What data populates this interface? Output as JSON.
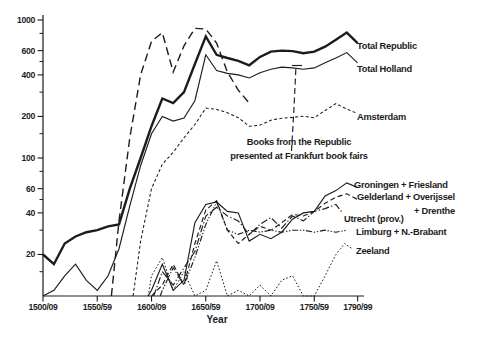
{
  "figure_title": "",
  "ink_color": "#1c1c1c",
  "background_color": "#ffffff",
  "chart_data": {
    "type": "line",
    "title": "",
    "xlabel": "Year",
    "ylabel": "",
    "y_axis": {
      "scale": "log",
      "baseline_value": 10,
      "top_value": 1100,
      "major_ticks": [
        1000,
        600,
        400,
        200,
        100,
        60,
        40,
        20
      ],
      "major_tick_labels": [
        "1000",
        "600",
        "400",
        "200",
        "100",
        "60",
        "40",
        "20"
      ],
      "minor_ticks": [
        800,
        500,
        300,
        150,
        80,
        50,
        30,
        15
      ]
    },
    "x_axis": {
      "tick_years": [
        1500,
        1550,
        1600,
        1650,
        1700,
        1750,
        1790
      ],
      "tick_labels": [
        "1500/09",
        "1550/59",
        "1600/09",
        "1650/59",
        "1700/09",
        "1750/59",
        "1790/99"
      ]
    },
    "annotation": {
      "lines": [
        "Books from the Republic",
        "presented at Frankfurt book fairs"
      ]
    },
    "series": [
      {
        "id": "frankfurt",
        "label_lines": [],
        "style": "dash-long",
        "points": [
          [
            1563,
            10
          ],
          [
            1570,
            35
          ],
          [
            1580,
            140
          ],
          [
            1590,
            400
          ],
          [
            1600,
            700
          ],
          [
            1610,
            810
          ],
          [
            1620,
            420
          ],
          [
            1630,
            650
          ],
          [
            1640,
            870
          ],
          [
            1650,
            860
          ],
          [
            1660,
            680
          ],
          [
            1670,
            420
          ],
          [
            1680,
            310
          ],
          [
            1690,
            250
          ]
        ]
      },
      {
        "id": "zeeland",
        "label_lines": [
          "Zeeland"
        ],
        "style": "dot-fine",
        "points": [
          [
            1597,
            10
          ],
          [
            1600,
            14
          ],
          [
            1610,
            19
          ],
          [
            1620,
            11
          ],
          [
            1630,
            15
          ],
          [
            1640,
            10
          ],
          [
            1650,
            11
          ],
          [
            1660,
            18
          ],
          [
            1670,
            10
          ],
          [
            1680,
            11
          ],
          [
            1690,
            10
          ],
          [
            1700,
            12
          ],
          [
            1710,
            10
          ],
          [
            1720,
            13
          ],
          [
            1730,
            14
          ],
          [
            1740,
            10
          ],
          [
            1750,
            10
          ],
          [
            1760,
            14
          ],
          [
            1770,
            20
          ],
          [
            1778,
            24
          ],
          [
            1785,
            22
          ]
        ]
      },
      {
        "id": "limburg-brabant",
        "label_lines": [
          "Limburg + N.-Brabant"
        ],
        "style": "dash-dot-dot",
        "points": [
          [
            1608,
            10
          ],
          [
            1610,
            11
          ],
          [
            1620,
            16
          ],
          [
            1630,
            12
          ],
          [
            1640,
            19
          ],
          [
            1650,
            33
          ],
          [
            1660,
            48
          ],
          [
            1670,
            30
          ],
          [
            1680,
            28
          ],
          [
            1690,
            30
          ],
          [
            1700,
            29
          ],
          [
            1710,
            30
          ],
          [
            1720,
            29
          ],
          [
            1730,
            30
          ],
          [
            1740,
            30
          ],
          [
            1750,
            29
          ],
          [
            1760,
            30
          ],
          [
            1770,
            29
          ],
          [
            1780,
            30
          ]
        ]
      },
      {
        "id": "utrecht",
        "label_lines": [
          "Utrecht (prov.)"
        ],
        "style": "dash-dot",
        "points": [
          [
            1602,
            10
          ],
          [
            1610,
            15
          ],
          [
            1620,
            12
          ],
          [
            1630,
            16
          ],
          [
            1640,
            21
          ],
          [
            1650,
            38
          ],
          [
            1660,
            44
          ],
          [
            1670,
            38
          ],
          [
            1680,
            35
          ],
          [
            1690,
            28
          ],
          [
            1700,
            33
          ],
          [
            1710,
            37
          ],
          [
            1720,
            31
          ],
          [
            1730,
            38
          ],
          [
            1740,
            35
          ],
          [
            1750,
            41
          ],
          [
            1760,
            43
          ],
          [
            1770,
            46
          ],
          [
            1776,
            40
          ]
        ]
      },
      {
        "id": "gelderland-overijssel-drenthe",
        "label_lines": [
          "Gelderland + Overijssel",
          "+ Drenthe"
        ],
        "style": "dash-med",
        "points": [
          [
            1600,
            10
          ],
          [
            1610,
            12
          ],
          [
            1620,
            17
          ],
          [
            1630,
            12
          ],
          [
            1640,
            24
          ],
          [
            1650,
            42
          ],
          [
            1660,
            49
          ],
          [
            1670,
            30
          ],
          [
            1680,
            24
          ],
          [
            1690,
            28
          ],
          [
            1700,
            32
          ],
          [
            1710,
            30
          ],
          [
            1720,
            34
          ],
          [
            1730,
            39
          ],
          [
            1740,
            38
          ],
          [
            1750,
            41
          ],
          [
            1760,
            47
          ],
          [
            1770,
            52
          ],
          [
            1780,
            55
          ],
          [
            1790,
            50
          ]
        ]
      },
      {
        "id": "groningen-friesland",
        "label_lines": [
          "Groningen + Friesland"
        ],
        "style": "solid-thin",
        "points": [
          [
            1597,
            10
          ],
          [
            1600,
            11
          ],
          [
            1610,
            17
          ],
          [
            1620,
            11
          ],
          [
            1630,
            13
          ],
          [
            1640,
            34
          ],
          [
            1650,
            46
          ],
          [
            1660,
            48
          ],
          [
            1670,
            41
          ],
          [
            1680,
            40
          ],
          [
            1690,
            25
          ],
          [
            1700,
            28
          ],
          [
            1710,
            26
          ],
          [
            1720,
            29
          ],
          [
            1730,
            36
          ],
          [
            1740,
            40
          ],
          [
            1750,
            41
          ],
          [
            1760,
            53
          ],
          [
            1770,
            58
          ],
          [
            1780,
            66
          ],
          [
            1790,
            61
          ]
        ]
      },
      {
        "id": "amsterdam",
        "label_lines": [
          "Amsterdam"
        ],
        "style": "dash-short",
        "points": [
          [
            1583,
            10
          ],
          [
            1590,
            25
          ],
          [
            1600,
            60
          ],
          [
            1610,
            90
          ],
          [
            1620,
            110
          ],
          [
            1630,
            140
          ],
          [
            1640,
            175
          ],
          [
            1650,
            230
          ],
          [
            1660,
            225
          ],
          [
            1670,
            213
          ],
          [
            1680,
            196
          ],
          [
            1690,
            170
          ],
          [
            1700,
            173
          ],
          [
            1710,
            188
          ],
          [
            1720,
            194
          ],
          [
            1730,
            197
          ],
          [
            1740,
            201
          ],
          [
            1750,
            196
          ],
          [
            1760,
            221
          ],
          [
            1770,
            248
          ],
          [
            1780,
            226
          ],
          [
            1790,
            210
          ]
        ]
      },
      {
        "id": "total-holland",
        "label_lines": [
          "Total Holland"
        ],
        "style": "solid-thin",
        "points": [
          [
            1500,
            10
          ],
          [
            1510,
            11
          ],
          [
            1520,
            14
          ],
          [
            1530,
            17
          ],
          [
            1540,
            13
          ],
          [
            1550,
            11
          ],
          [
            1560,
            14
          ],
          [
            1570,
            22
          ],
          [
            1580,
            45
          ],
          [
            1590,
            88
          ],
          [
            1600,
            150
          ],
          [
            1610,
            200
          ],
          [
            1620,
            185
          ],
          [
            1630,
            195
          ],
          [
            1640,
            260
          ],
          [
            1650,
            560
          ],
          [
            1660,
            430
          ],
          [
            1670,
            410
          ],
          [
            1680,
            400
          ],
          [
            1690,
            380
          ],
          [
            1700,
            415
          ],
          [
            1710,
            440
          ],
          [
            1720,
            455
          ],
          [
            1730,
            450
          ],
          [
            1740,
            440
          ],
          [
            1750,
            450
          ],
          [
            1760,
            490
          ],
          [
            1770,
            530
          ],
          [
            1780,
            580
          ],
          [
            1790,
            490
          ]
        ]
      },
      {
        "id": "total-republic",
        "label_lines": [
          "Total Republic"
        ],
        "style": "solid-thick",
        "points": [
          [
            1500,
            20
          ],
          [
            1510,
            17
          ],
          [
            1520,
            24
          ],
          [
            1530,
            27
          ],
          [
            1540,
            29
          ],
          [
            1550,
            30
          ],
          [
            1560,
            32
          ],
          [
            1570,
            33
          ],
          [
            1580,
            60
          ],
          [
            1590,
            100
          ],
          [
            1600,
            170
          ],
          [
            1610,
            270
          ],
          [
            1620,
            250
          ],
          [
            1630,
            300
          ],
          [
            1640,
            480
          ],
          [
            1650,
            760
          ],
          [
            1660,
            560
          ],
          [
            1670,
            530
          ],
          [
            1680,
            505
          ],
          [
            1690,
            470
          ],
          [
            1700,
            540
          ],
          [
            1710,
            590
          ],
          [
            1720,
            600
          ],
          [
            1730,
            595
          ],
          [
            1740,
            575
          ],
          [
            1750,
            590
          ],
          [
            1760,
            640
          ],
          [
            1770,
            720
          ],
          [
            1780,
            810
          ],
          [
            1790,
            680
          ]
        ]
      }
    ]
  }
}
